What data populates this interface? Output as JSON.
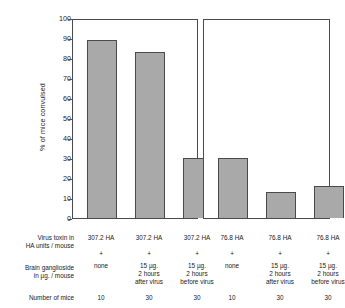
{
  "chart_data": {
    "type": "bar",
    "title": "",
    "xlabel": "",
    "ylabel": "% of mice convulsed",
    "ylim": [
      0,
      100
    ],
    "ytick_step": 10,
    "yticks": [
      0,
      10,
      20,
      30,
      40,
      50,
      60,
      70,
      80,
      90,
      100
    ],
    "grid": false,
    "legend": "none",
    "panels": [
      {
        "name": "307.2 HA units panel",
        "categories": [
          "307.2 HA + none",
          "307.2 HA + 15 µg. 2 hours after virus",
          "307.2 HA + 15 µg. 2 hours before virus"
        ],
        "values": [
          89,
          83,
          30
        ]
      },
      {
        "name": "76.8 HA units panel",
        "categories": [
          "76.8 HA + none",
          "76.8 HA + 15 µg. 2 hours after virus",
          "76.8 HA + 15 µg. 2 hours before virus"
        ],
        "values": [
          30,
          13,
          16
        ]
      }
    ],
    "categories": [
      "307.2 HA + none",
      "307.2 HA + 15 µg. 2 hours after virus",
      "307.2 HA + 15 µg. 2 hours before virus",
      "76.8 HA + none",
      "76.8 HA + 15 µg. 2 hours after virus",
      "76.8 HA + 15 µg. 2 hours before virus"
    ],
    "values": [
      89,
      83,
      30,
      30,
      13,
      16
    ],
    "bar_color": "#a9a9a9",
    "bar_edge_color": "#4a4a4a"
  },
  "axis": {
    "ylabel": "% of mice convulsed",
    "ticks": [
      "100",
      "90",
      "80",
      "70",
      "60",
      "50",
      "40",
      "30",
      "20",
      "10",
      "0"
    ]
  },
  "table": {
    "row_labels": [
      "Virus toxin in\nHA units / mouse",
      "Brain ganglioside\nin µg. / mouse",
      "Number of mice"
    ],
    "row_labels_flat": [
      {
        "line1": "Virus toxin in",
        "line2": "HA units / mouse"
      },
      {
        "line1": "Brain ganglioside",
        "line2": "in µg. / mouse"
      },
      {
        "line1": "Number of mice",
        "line2": ""
      }
    ],
    "columns": [
      {
        "toxin": "307.2 HA",
        "plus": "+",
        "ganglioside_line1": "none",
        "ganglioside_line2": "",
        "ganglioside_line3": "",
        "n": "10"
      },
      {
        "toxin": "307.2 HA",
        "plus": "+",
        "ganglioside_line1": "15 µg.",
        "ganglioside_line2": "2 hours",
        "ganglioside_line3": "after virus",
        "n": "30"
      },
      {
        "toxin": "307.2 HA",
        "plus": "+",
        "ganglioside_line1": "15 µg.",
        "ganglioside_line2": "2 hours",
        "ganglioside_line3": "before virus",
        "n": "30"
      },
      {
        "toxin": "76.8 HA",
        "plus": "+",
        "ganglioside_line1": "none",
        "ganglioside_line2": "",
        "ganglioside_line3": "",
        "n": "10"
      },
      {
        "toxin": "76.8 HA",
        "plus": "+",
        "ganglioside_line1": "15 µg.",
        "ganglioside_line2": "2 hours",
        "ganglioside_line3": "after virus",
        "n": "30"
      },
      {
        "toxin": "76.8 HA",
        "plus": "+",
        "ganglioside_line1": "15 µg.",
        "ganglioside_line2": "2 hours",
        "ganglioside_line3": "before virus",
        "n": "30"
      }
    ]
  }
}
